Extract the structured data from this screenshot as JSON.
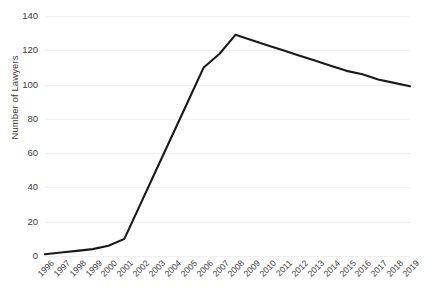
{
  "chart_data": {
    "type": "line",
    "title": "",
    "xlabel": "",
    "ylabel": "Number of Lawyers",
    "ylim": [
      0,
      140
    ],
    "yticks": [
      0,
      20,
      40,
      60,
      80,
      100,
      120,
      140
    ],
    "grid": true,
    "legend": "none",
    "line_color": "#1a1a1a",
    "grid_color": "#f0f0f0",
    "categories": [
      "1996",
      "1997",
      "1998",
      "1999",
      "2000",
      "2001",
      "2002",
      "2003",
      "2004",
      "2005",
      "2006",
      "2007",
      "2008",
      "2009",
      "2010",
      "2011",
      "2012",
      "2013",
      "2014",
      "2015",
      "2016",
      "2017",
      "2018",
      "2019"
    ],
    "values": [
      1,
      2,
      3,
      4,
      6,
      10,
      30,
      50,
      70,
      90,
      110,
      118,
      129,
      126,
      123,
      120,
      117,
      114,
      111,
      108,
      106,
      103,
      101,
      99
    ]
  }
}
